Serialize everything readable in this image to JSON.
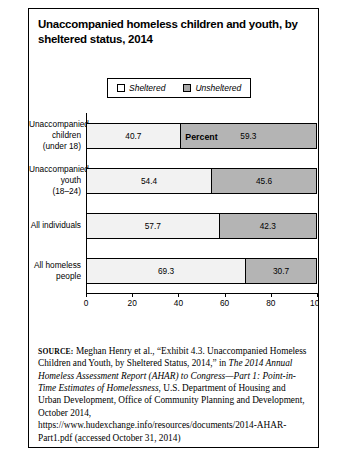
{
  "figure": {
    "title": "Unaccompanied homeless children and youth, by sheltered status, 2014",
    "legend": {
      "sheltered_label": "Sheltered",
      "unsheltered_label": "Unsheltered"
    },
    "source": {
      "label": "SOURCE:",
      "text_1": " Meghan Henry et al., “Exhibit 4.3. Unaccompanied Homeless Children and Youth, by Sheltered Status, 2014,” in ",
      "text_italic_1": "The 2014 Annual Homeless Assessment Report (AHAR) to Congress—Part 1: Point-in-Time Estimates of Homelessness",
      "text_2": ", U.S. Department of Housing and Urban Development, Office of Community Planning and Development, October 2014, https://www.hudexchange.info/resources/documents/2014-AHAR-Part1.pdf (accessed October 31, 2014)"
    }
  },
  "chart_data": {
    "type": "bar",
    "orientation": "horizontal",
    "stacked": true,
    "title": "Unaccompanied homeless children and youth, by sheltered status, 2014",
    "xlabel": "Percent",
    "ylabel": "",
    "xlim": [
      0,
      100
    ],
    "xticks": [
      0,
      20,
      40,
      60,
      80,
      100
    ],
    "xtick_labels": [
      "0",
      "20",
      "40",
      "60",
      "80",
      "100"
    ],
    "grid": false,
    "legend_position": "top-center",
    "categories": [
      "Unaccompanied children (under 18)",
      "Unaccompanied youth (18–24)",
      "All individuals",
      "All homeless people"
    ],
    "category_lines": [
      [
        "Unaccompanied",
        "children",
        "(under 18)"
      ],
      [
        "Unaccompanied",
        "youth",
        "(18–24)"
      ],
      [
        "All individuals"
      ],
      [
        "All homeless",
        "people"
      ]
    ],
    "series": [
      {
        "name": "Sheltered",
        "color": "#f2f2f2",
        "values": [
          40.7,
          54.4,
          57.7,
          69.3
        ],
        "value_labels": [
          "40.7",
          "54.4",
          "57.7",
          "69.3"
        ]
      },
      {
        "name": "Unsheltered",
        "color": "#b4b4b4",
        "values": [
          59.3,
          45.6,
          42.3,
          30.7
        ],
        "value_labels": [
          "59.3",
          "45.6",
          "42.3",
          "30.7"
        ]
      }
    ]
  }
}
